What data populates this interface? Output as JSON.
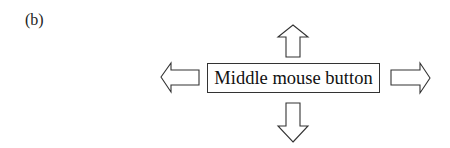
{
  "figure": {
    "panel_label": "(b)",
    "center_box": {
      "label": "Middle mouse button"
    },
    "arrows": [
      {
        "direction": "up",
        "icon": "arrow-up-outline-icon"
      },
      {
        "direction": "left",
        "icon": "arrow-left-outline-icon"
      },
      {
        "direction": "right",
        "icon": "arrow-right-outline-icon"
      },
      {
        "direction": "down",
        "icon": "arrow-down-outline-icon"
      }
    ],
    "colors": {
      "stroke": "#333333",
      "fill": "#ffffff",
      "text": "#111111"
    }
  }
}
